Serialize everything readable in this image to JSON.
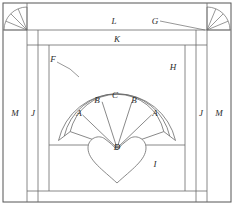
{
  "figure": {
    "kind": "patent-line-drawing",
    "stroke_color": "#6b6b6b",
    "outer_frame_color": "#555555",
    "label_color": "#2b2b2b",
    "background": "#ffffff",
    "width": 234,
    "height": 205
  },
  "labels": {
    "A_left": "A",
    "A_right": "A",
    "B_left": "B",
    "B_right": "B",
    "C": "C",
    "D": "D",
    "F": "F",
    "G": "G",
    "H": "H",
    "I": "I",
    "J_left": "J",
    "J_right": "J",
    "K": "K",
    "L": "L",
    "M_left": "M",
    "M_right": "M"
  },
  "parts": [
    {
      "id": "A",
      "name": "outer fan blade",
      "count": 2
    },
    {
      "id": "B",
      "name": "inner fan blade",
      "count": 2
    },
    {
      "id": "C",
      "name": "center fan blade",
      "count": 1
    },
    {
      "id": "D",
      "name": "heart center appliqué",
      "count": 1
    },
    {
      "id": "F",
      "name": "outer fan arc band",
      "count": 1
    },
    {
      "id": "G",
      "name": "corner fan wedge",
      "count": 2
    },
    {
      "id": "H",
      "name": "background field",
      "count": 1
    },
    {
      "id": "I",
      "name": "lower background field",
      "count": 1
    },
    {
      "id": "J",
      "name": "inner vertical sashing",
      "count": 2
    },
    {
      "id": "K",
      "name": "horizontal sashing",
      "count": 1
    },
    {
      "id": "L",
      "name": "top border strip",
      "count": 1
    },
    {
      "id": "M",
      "name": "outer vertical border",
      "count": 2
    }
  ],
  "leaders": [
    {
      "from": "G",
      "to": "corner-fan-right"
    },
    {
      "from": "F",
      "to": "outer-fan-arc"
    }
  ]
}
